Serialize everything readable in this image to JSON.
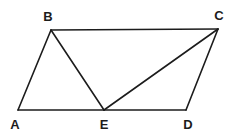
{
  "figure": {
    "type": "geometric-diagram",
    "background_color": "#ffffff",
    "stroke_color": "#1c1c1c",
    "label_color": "#1c1c1c",
    "stroke_width": 1.6,
    "canvas": {
      "width": 237,
      "height": 136
    }
  },
  "points": [
    {
      "name": "A",
      "label": "A",
      "x": 18,
      "y": 110,
      "label_x": 15,
      "label_y": 124
    },
    {
      "name": "B",
      "label": "B",
      "x": 51,
      "y": 30,
      "label_x": 48,
      "label_y": 16
    },
    {
      "name": "C",
      "label": "C",
      "x": 218,
      "y": 29,
      "label_x": 219,
      "label_y": 15
    },
    {
      "name": "D",
      "label": "D",
      "x": 186,
      "y": 110,
      "label_x": 188,
      "label_y": 124
    },
    {
      "name": "E",
      "label": "E",
      "x": 104,
      "y": 110,
      "label_x": 104,
      "label_y": 124
    }
  ],
  "segments": [
    {
      "name": "segment-AB",
      "from": "A",
      "to": "B"
    },
    {
      "name": "segment-BC",
      "from": "B",
      "to": "C"
    },
    {
      "name": "segment-CD",
      "from": "C",
      "to": "D"
    },
    {
      "name": "segment-DE",
      "from": "D",
      "to": "E"
    },
    {
      "name": "segment-EA",
      "from": "E",
      "to": "A"
    },
    {
      "name": "segment-BE",
      "from": "B",
      "to": "E"
    },
    {
      "name": "segment-EC",
      "from": "E",
      "to": "C"
    }
  ]
}
